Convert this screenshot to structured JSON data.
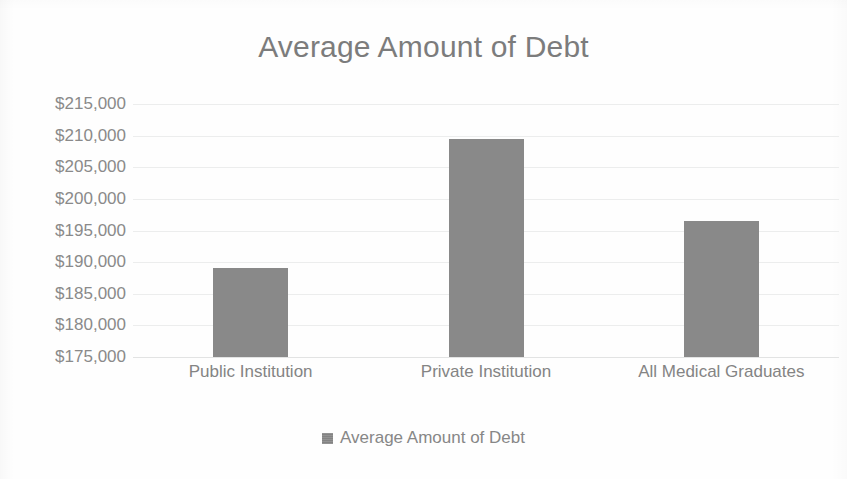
{
  "chart_data": {
    "type": "bar",
    "title": "Average Amount of Debt",
    "xlabel": "",
    "ylabel": "",
    "categories": [
      "Public Institution",
      "Private Institution",
      "All Medical Graduates"
    ],
    "values": [
      189000,
      209500,
      196500
    ],
    "series": [
      {
        "name": "Average Amount of Debt",
        "values": [
          189000,
          209500,
          196500
        ]
      }
    ],
    "ylim": [
      175000,
      215000
    ],
    "ytick_values": [
      215000,
      210000,
      205000,
      200000,
      195000,
      190000,
      185000,
      180000,
      175000
    ],
    "ytick_labels": [
      "$215,000",
      "$210,000",
      "$205,000",
      "$200,000",
      "$195,000",
      "$190,000",
      "$185,000",
      "$180,000",
      "$175,000"
    ],
    "grid": true,
    "legend_position": "bottom",
    "legend_entries": [
      "Average Amount of Debt"
    ],
    "bar_color": "#898989",
    "grid_color": "#eceded",
    "text_color": "#858585",
    "title_color": "#7c7c7c",
    "background_color": "#ffffff"
  },
  "legend": {
    "marker_icon": "square-marker-icon",
    "label": "Average Amount of Debt"
  }
}
